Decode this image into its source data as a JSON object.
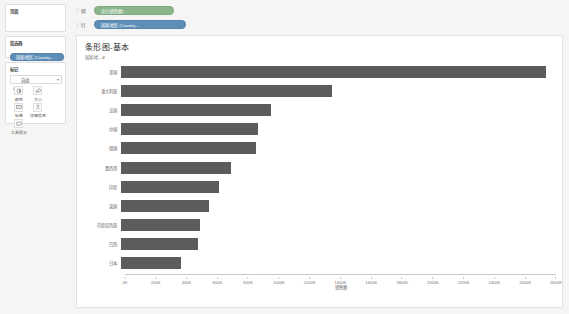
{
  "sidebar": {
    "pages": {
      "title": "页面"
    },
    "filters": {
      "title": "筛选器",
      "pills": [
        {
          "label": "国家/地区 (Country…"
        }
      ]
    },
    "marks": {
      "title": "标记",
      "type_label": "自动",
      "type_icon": "bar-mark-icon",
      "caret": "▾",
      "buttons": [
        {
          "label": "颜色",
          "icon": "color-palette-icon"
        },
        {
          "label": "大小",
          "icon": "size-icon"
        },
        {
          "label": "标签",
          "icon": "label-icon"
        },
        {
          "label": "详细信息",
          "icon": "detail-icon"
        },
        {
          "label": "工具提示",
          "icon": "tooltip-icon"
        }
      ]
    }
  },
  "shelves": {
    "columns": {
      "label": "列",
      "pill": "总计(销售额)",
      "pill_color": "#8ab58a"
    },
    "rows": {
      "label": "行",
      "pill": "国家/地区 (Country…",
      "pill_color": "#5d8eb8"
    }
  },
  "viz": {
    "title": "条形图-基本",
    "y_axis_header": "国家/地…₽"
  },
  "chart_data": {
    "type": "bar",
    "orientation": "horizontal",
    "title": "条形图-基本",
    "xlabel": "销售额",
    "ylabel": "国家/地区",
    "xlim": [
      0,
      2800000
    ],
    "grid": false,
    "bar_color": "#5c5c5c",
    "xticks": [
      "0K",
      "200K",
      "400K",
      "600K",
      "800K",
      "1000K",
      "1200K",
      "1400K",
      "1600K",
      "1800K",
      "2000K",
      "2200K",
      "2400K",
      "2600K",
      "2800K"
    ],
    "xtick_values": [
      0,
      200000,
      400000,
      600000,
      800000,
      1000000,
      1200000,
      1400000,
      1600000,
      1800000,
      2000000,
      2200000,
      2400000,
      2600000,
      2800000
    ],
    "categories": [
      "美国",
      "澳大利亚",
      "法国",
      "中国",
      "德国",
      "墨西哥",
      "印度",
      "英国",
      "印度尼西亚",
      "巴西",
      "日本"
    ],
    "values": [
      2700000,
      1340000,
      950000,
      870000,
      860000,
      700000,
      620000,
      560000,
      500000,
      490000,
      380000
    ]
  }
}
